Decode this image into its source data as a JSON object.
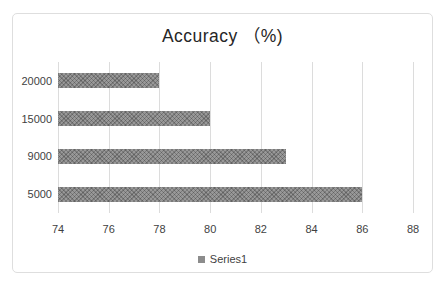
{
  "chart_data": {
    "type": "bar",
    "orientation": "horizontal",
    "title": "Accuracy （%)",
    "categories": [
      "20000",
      "15000",
      "9000",
      "5000"
    ],
    "series": [
      {
        "name": "Series1",
        "values": [
          78,
          80,
          83,
          86
        ]
      }
    ],
    "xticks": [
      74,
      76,
      78,
      80,
      82,
      84,
      86,
      88
    ],
    "xlim": [
      74,
      88
    ],
    "grid": "vertical-gridlines-on",
    "legend_position": "bottom",
    "colors": {
      "bar": "#8c8c8c",
      "gridline": "#dcdcdc",
      "title_text": "#262626",
      "axis_text": "#3f3f3f",
      "frame_border": "#dedede",
      "background": "#ffffff"
    }
  }
}
